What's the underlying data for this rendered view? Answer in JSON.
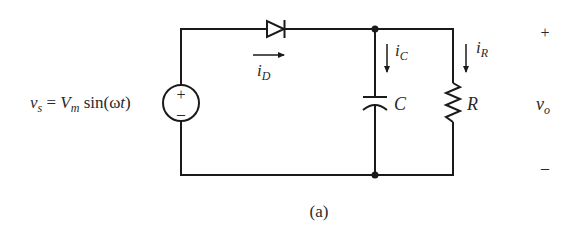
{
  "figure": {
    "caption": "(a)",
    "type": "half-wave rectifier with capacitor filter"
  },
  "source": {
    "label_v": "v",
    "label_v_sub": "s",
    "label_eq": " = ",
    "label_Vm": "V",
    "label_Vm_sub": "m",
    "label_func": " sin(",
    "label_omega": "ω",
    "label_t": "t",
    "label_close": ")",
    "plus": "+",
    "minus": "–"
  },
  "diode": {
    "current_label": "i",
    "current_sub": "D"
  },
  "capacitor": {
    "label": "C",
    "current_label": "i",
    "current_sub": "C"
  },
  "resistor": {
    "label": "R",
    "current_label": "i",
    "current_sub": "R"
  },
  "output": {
    "plus": "+",
    "minus": "–",
    "label_v": "v",
    "label_v_sub": "o"
  },
  "colors": {
    "line": "#1a1a1a",
    "text": "#2a2a2a",
    "background": "#ffffff"
  }
}
